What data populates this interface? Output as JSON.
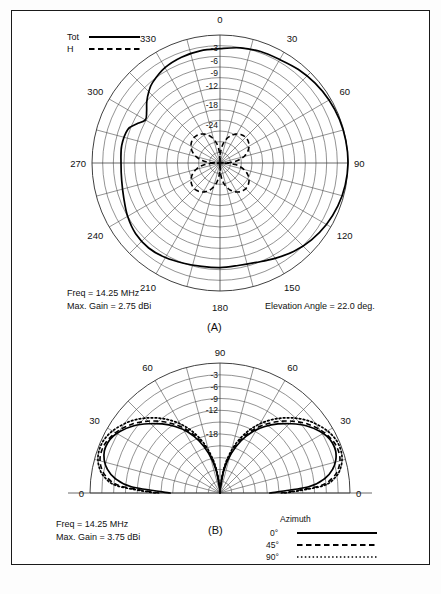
{
  "figure": {
    "panels": [
      {
        "id": "A",
        "caption": "(A)",
        "type": "azimuth-polar-plot",
        "freq_label": "Freq =  14.25 MHz",
        "gain_label": "Max. Gain =  2.75 dBi",
        "angle_label": "Elevation Angle =  22.0 deg.",
        "legend": {
          "entries": [
            {
              "label": "Tot",
              "style": "solid"
            },
            {
              "label": "H",
              "style": "dashed"
            }
          ]
        },
        "angle_ticks": [
          "0",
          "30",
          "60",
          "90",
          "120",
          "150",
          "180",
          "210",
          "240",
          "270",
          "300",
          "330"
        ],
        "ring_ticks": [
          "-3",
          "-6",
          "-9",
          "-12",
          "-18",
          "-24"
        ]
      },
      {
        "id": "B",
        "caption": "(B)",
        "type": "elevation-polar-plot",
        "freq_label": "Freq =  14.25 MHz",
        "gain_label": "Max. Gain =  3.75 dBi",
        "legend": {
          "title": "Azimuth",
          "entries": [
            {
              "label": "0°",
              "style": "solid"
            },
            {
              "label": "45°",
              "style": "dashed"
            },
            {
              "label": "90°",
              "style": "dotted"
            }
          ]
        },
        "angle_ticks": [
          "0",
          "30",
          "60",
          "90",
          "60",
          "30",
          "0"
        ],
        "ring_ticks": [
          "-3",
          "-6",
          "-9",
          "-12",
          "-18"
        ]
      }
    ]
  },
  "chart_data": [
    {
      "type": "line",
      "subtype": "polar",
      "title": "(A) Azimuth pattern",
      "xlabel": "Azimuth angle (deg)",
      "ylabel": "Relative gain (dB)",
      "rlim": [
        -30,
        0
      ],
      "ring_values": [
        -3,
        -6,
        -9,
        -12,
        -18,
        -24
      ],
      "angle_ticks_deg": [
        0,
        30,
        60,
        90,
        120,
        150,
        180,
        210,
        240,
        270,
        300,
        330
      ],
      "grid": true,
      "legend_position": "top-left",
      "annotations": [
        "Freq =  14.25 MHz",
        "Max. Gain =  2.75 dBi",
        "Elevation Angle =  22.0 deg."
      ],
      "series": [
        {
          "name": "Tot",
          "style": "solid",
          "azimuth_deg": [
            0,
            10,
            20,
            30,
            40,
            50,
            60,
            70,
            80,
            90,
            100,
            110,
            120,
            130,
            140,
            150,
            160,
            170,
            180,
            190,
            200,
            210,
            220,
            230,
            240,
            250,
            260,
            270,
            280,
            290,
            295,
            300,
            305,
            310,
            315,
            320,
            330,
            340,
            350,
            360
          ],
          "values_db": [
            -3.2,
            -2.6,
            -2.2,
            -2.0,
            -1.4,
            -0.9,
            -0.5,
            -0.2,
            -0.05,
            0.0,
            -0.2,
            -0.6,
            -1.2,
            -2.0,
            -3.0,
            -4.2,
            -5.2,
            -5.6,
            -5.5,
            -5.4,
            -5.0,
            -4.4,
            -4.0,
            -4.2,
            -5.0,
            -6.0,
            -6.6,
            -6.8,
            -6.6,
            -7.0,
            -8.4,
            -9.8,
            -9.0,
            -7.6,
            -6.4,
            -5.4,
            -4.2,
            -3.6,
            -3.3,
            -3.2
          ]
        },
        {
          "name": "H",
          "style": "dashed",
          "azimuth_deg": [
            0,
            15,
            30,
            45,
            60,
            75,
            90,
            105,
            120,
            135,
            150,
            165,
            180,
            195,
            210,
            225,
            240,
            255,
            270,
            285,
            300,
            315,
            330,
            345,
            360
          ],
          "values_db": [
            -30,
            -26,
            -23.5,
            -22.8,
            -23.5,
            -26,
            -30,
            -26,
            -23.5,
            -22.8,
            -23.5,
            -26,
            -30,
            -26,
            -23.5,
            -22.8,
            -23.5,
            -26,
            -30,
            -26,
            -23.5,
            -22.8,
            -23.5,
            -26,
            -30
          ]
        }
      ]
    },
    {
      "type": "line",
      "subtype": "polar-half",
      "title": "(B) Elevation pattern",
      "xlabel": "Elevation angle (deg)",
      "ylabel": "Relative gain (dB)",
      "rlim": [
        -30,
        0
      ],
      "ring_values": [
        -3,
        -6,
        -9,
        -12,
        -18
      ],
      "angle_ticks_deg": [
        0,
        30,
        60,
        90,
        120,
        150,
        180
      ],
      "grid": true,
      "legend_position": "bottom-right",
      "annotations": [
        "Freq =  14.25 MHz",
        "Max. Gain =  3.75 dBi"
      ],
      "series": [
        {
          "name": "0°",
          "style": "solid",
          "elevation_deg": [
            0,
            4,
            8,
            12,
            16,
            20,
            24,
            28,
            32,
            38,
            44,
            50,
            56,
            62,
            68,
            74,
            80,
            86,
            90
          ],
          "values_db": [
            -18.5,
            -9.5,
            -5.5,
            -3.4,
            -2.2,
            -1.6,
            -1.6,
            -2.1,
            -3.0,
            -4.8,
            -7.0,
            -9.2,
            -11.5,
            -14.0,
            -17.0,
            -20.5,
            -24.5,
            -29,
            -34
          ]
        },
        {
          "name": "45°",
          "style": "dashed",
          "elevation_deg": [
            0,
            4,
            8,
            12,
            16,
            20,
            24,
            28,
            32,
            38,
            44,
            50,
            56,
            62,
            68,
            74,
            80,
            86,
            90
          ],
          "values_db": [
            -16.0,
            -7.0,
            -3.6,
            -2.0,
            -1.2,
            -1.0,
            -1.2,
            -1.8,
            -2.6,
            -4.2,
            -6.2,
            -8.4,
            -10.8,
            -13.4,
            -16.4,
            -20.0,
            -24.0,
            -28.5,
            -33
          ]
        },
        {
          "name": "90°",
          "style": "dotted",
          "elevation_deg": [
            0,
            4,
            8,
            12,
            16,
            20,
            24,
            28,
            32,
            38,
            44,
            50,
            56,
            62,
            68,
            74,
            80,
            86,
            90
          ],
          "values_db": [
            -15.0,
            -6.2,
            -3.0,
            -1.5,
            -0.7,
            -0.4,
            -0.5,
            -1.0,
            -1.8,
            -3.3,
            -5.2,
            -7.4,
            -9.8,
            -12.5,
            -15.6,
            -19.2,
            -23.4,
            -28.0,
            -32.5
          ]
        }
      ]
    }
  ]
}
